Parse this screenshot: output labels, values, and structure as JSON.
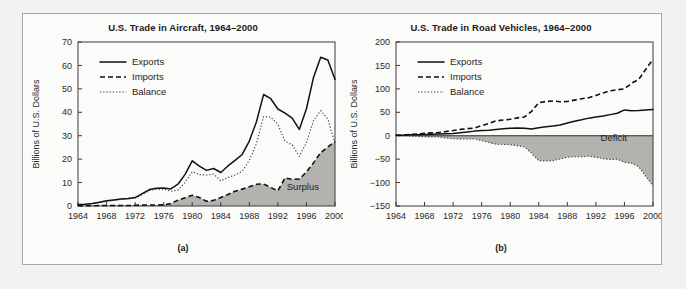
{
  "figure": {
    "background_color": "#f3f2f0",
    "panel_background": "#fbfbfa",
    "fill_color": "#b4b2ae",
    "line_color": "#111111"
  },
  "panels": [
    {
      "id": "a",
      "caption": "(a)",
      "title": "U.S. Trade in Aircraft, 1964–2000",
      "ylabel": "Billions of U.S. Dollars",
      "region_label": "Surplus",
      "legend": [
        {
          "label": "Exports",
          "style": "solid"
        },
        {
          "label": "Imports",
          "style": "dashed"
        },
        {
          "label": "Balance",
          "style": "dotted"
        }
      ]
    },
    {
      "id": "b",
      "caption": "(b)",
      "title": "U.S. Trade in Road Vehicles, 1964–2000",
      "ylabel": "Billions of U.S. Dollars",
      "region_label": "Deficit",
      "legend": [
        {
          "label": "Exports",
          "style": "solid"
        },
        {
          "label": "Imports",
          "style": "dashed"
        },
        {
          "label": "Balance",
          "style": "dotted"
        }
      ]
    }
  ],
  "chart_data": [
    {
      "type": "line",
      "panel": "a",
      "title": "U.S. Trade in Aircraft, 1964–2000",
      "xlabel": "",
      "ylabel": "Billions of U.S. Dollars",
      "xlim": [
        1964,
        2000
      ],
      "ylim": [
        0,
        70
      ],
      "yticks": [
        0,
        10,
        20,
        30,
        40,
        50,
        60,
        70
      ],
      "xticks": [
        1964,
        1968,
        1972,
        1976,
        1980,
        1984,
        1988,
        1992,
        1996,
        2000
      ],
      "grid": false,
      "legend_position": "upper-left",
      "annotations": [
        {
          "text": "Surplus",
          "x": 1995.5,
          "y": 7
        }
      ],
      "x": [
        1964,
        1965,
        1966,
        1967,
        1968,
        1969,
        1970,
        1971,
        1972,
        1973,
        1974,
        1975,
        1976,
        1977,
        1978,
        1979,
        1980,
        1981,
        1982,
        1983,
        1984,
        1985,
        1986,
        1987,
        1988,
        1989,
        1990,
        1991,
        1992,
        1993,
        1994,
        1995,
        1996,
        1997,
        1998,
        1999,
        2000
      ],
      "series": [
        {
          "name": "Exports",
          "style": "solid",
          "values": [
            0.6,
            0.8,
            1.1,
            1.6,
            2.2,
            2.6,
            3.0,
            3.2,
            3.6,
            5.3,
            7.0,
            7.6,
            7.7,
            7.3,
            9.3,
            13.5,
            19.3,
            17.0,
            15.2,
            16.0,
            14.3,
            17.1,
            19.5,
            22.0,
            27.7,
            36.0,
            47.6,
            45.8,
            41.4,
            39.6,
            37.5,
            32.7,
            41.5,
            55.0,
            63.5,
            62.3,
            54.0
          ]
        },
        {
          "name": "Imports",
          "style": "dashed",
          "values": [
            0.1,
            0.1,
            0.1,
            0.2,
            0.2,
            0.2,
            0.2,
            0.2,
            0.3,
            0.4,
            0.4,
            0.4,
            0.5,
            1.0,
            2.5,
            3.5,
            4.6,
            3.6,
            2.0,
            2.4,
            3.6,
            4.9,
            6.3,
            7.2,
            8.2,
            9.3,
            9.4,
            7.9,
            6.5,
            12.0,
            11.4,
            11.5,
            14.5,
            18.5,
            22.8,
            25.2,
            27.5
          ]
        },
        {
          "name": "Balance",
          "style": "dotted",
          "values": [
            0.5,
            0.7,
            1.0,
            1.4,
            2.0,
            2.4,
            2.8,
            3.0,
            3.3,
            4.9,
            6.6,
            7.2,
            7.2,
            6.3,
            6.8,
            10.0,
            14.7,
            13.4,
            13.2,
            13.6,
            10.7,
            12.2,
            13.2,
            14.8,
            19.5,
            26.7,
            38.2,
            37.9,
            34.9,
            27.6,
            26.1,
            21.2,
            27.0,
            36.5,
            40.7,
            37.1,
            26.5
          ]
        }
      ]
    },
    {
      "type": "line",
      "panel": "b",
      "title": "U.S. Trade in Road Vehicles, 1964–2000",
      "xlabel": "",
      "ylabel": "Billions of U.S. Dollars",
      "xlim": [
        1964,
        2000
      ],
      "ylim": [
        -150,
        200
      ],
      "yticks": [
        -150,
        -100,
        -50,
        0,
        50,
        100,
        150,
        200
      ],
      "xticks": [
        1964,
        1968,
        1972,
        1976,
        1980,
        1984,
        1988,
        1992,
        1996,
        2000
      ],
      "grid": false,
      "legend_position": "upper-left",
      "annotations": [
        {
          "text": "Deficit",
          "x": 1994.5,
          "y": -12
        }
      ],
      "x": [
        1964,
        1965,
        1966,
        1967,
        1968,
        1969,
        1970,
        1971,
        1972,
        1973,
        1974,
        1975,
        1976,
        1977,
        1978,
        1979,
        1980,
        1981,
        1982,
        1983,
        1984,
        1985,
        1986,
        1987,
        1988,
        1989,
        1990,
        1991,
        1992,
        1993,
        1994,
        1995,
        1996,
        1997,
        1998,
        1999,
        2000
      ],
      "series": [
        {
          "name": "Exports",
          "style": "solid",
          "values": [
            0.8,
            1.2,
            1.8,
            2.2,
            2.7,
            3.2,
            3.6,
            4.0,
            4.7,
            6.3,
            8.0,
            9.8,
            11.2,
            11.5,
            13.5,
            15.0,
            16.0,
            16.5,
            16.0,
            14.5,
            17.0,
            19.0,
            20.5,
            23.0,
            27.0,
            31.0,
            34.0,
            37.5,
            40.0,
            42.0,
            45.0,
            48.0,
            55.0,
            53.5,
            54.0,
            55.0,
            56.0
          ]
        },
        {
          "name": "Imports",
          "style": "dashed",
          "values": [
            0.9,
            1.5,
            2.6,
            3.5,
            5.0,
            6.0,
            6.5,
            9.0,
            11.0,
            13.5,
            15.0,
            16.5,
            21.5,
            26.0,
            31.5,
            33.5,
            35.0,
            38.0,
            40.0,
            52.0,
            70.5,
            73.0,
            74.0,
            72.5,
            73.0,
            76.0,
            79.0,
            81.0,
            86.0,
            91.0,
            96.0,
            98.0,
            100.0,
            112.0,
            120.0,
            142.0,
            163.0
          ]
        },
        {
          "name": "Balance",
          "style": "dotted",
          "values": [
            -0.1,
            -0.3,
            -0.8,
            -1.3,
            -2.3,
            -2.8,
            -2.9,
            -5.0,
            -6.3,
            -7.2,
            -7.0,
            -6.7,
            -10.3,
            -14.5,
            -18.0,
            -18.5,
            -19.0,
            -21.5,
            -24.0,
            -37.5,
            -53.5,
            -54.0,
            -53.5,
            -49.5,
            -46.0,
            -45.0,
            -45.0,
            -43.5,
            -46.0,
            -49.0,
            -51.0,
            -50.0,
            -57.0,
            -58.5,
            -66.0,
            -87.0,
            -107.0
          ]
        }
      ]
    }
  ]
}
